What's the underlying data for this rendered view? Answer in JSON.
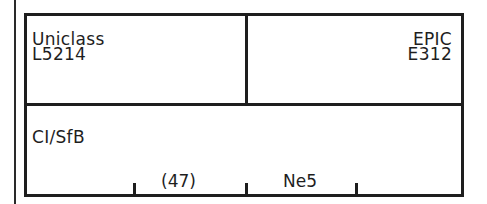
{
  "uniclass": {
    "label": "Uniclass",
    "code": "L5214"
  },
  "epic": {
    "label": "EPIC",
    "code": "E312"
  },
  "cisfb": {
    "label": "CI/SfB",
    "fields": [
      "",
      "(47)",
      "Ne5",
      ""
    ]
  },
  "colors": {
    "line": "#1e1e1e",
    "background": "#ffffff"
  }
}
